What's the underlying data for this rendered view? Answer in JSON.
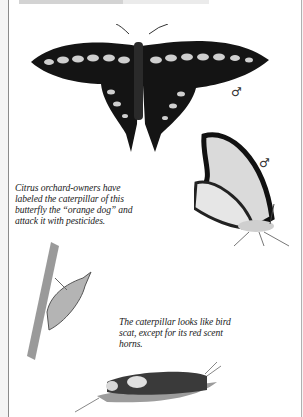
{
  "page": {
    "heading_cut_off": "",
    "captions": {
      "orange_dog": "Citrus orchard-owners have labeled the caterpillar of this butterfly the “orange dog” and attack it with pesticides.",
      "bird_scat": "The caterpillar looks like bird scat, except for its red scent horns."
    },
    "symbols": {
      "male_1": "♂",
      "male_2": "♂"
    },
    "illustrations": [
      "giant-swallowtail-dorsal",
      "giant-swallowtail-ventral",
      "chrysalis-on-twig",
      "caterpillar-on-leaf"
    ]
  }
}
